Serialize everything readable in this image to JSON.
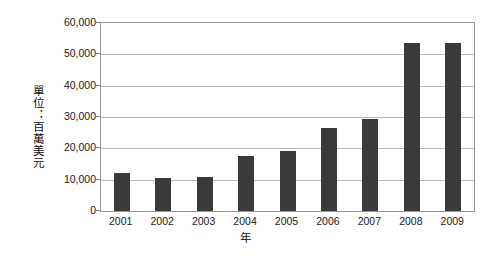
{
  "chart_data": {
    "type": "bar",
    "title": "",
    "subtitle": "",
    "xlabel": "年",
    "ylabel": "單位：百萬美元",
    "categories": [
      "2001",
      "2002",
      "2003",
      "2004",
      "2005",
      "2006",
      "2007",
      "2008",
      "2009"
    ],
    "values": [
      12000,
      10400,
      11000,
      17500,
      19000,
      26500,
      29500,
      53700,
      53500
    ],
    "ylim": [
      0,
      60000
    ],
    "ytick_labels": [
      "60,000",
      "50,000",
      "40,000",
      "30,000",
      "20,000",
      "10,000",
      "0"
    ],
    "ytick_values": [
      60000,
      50000,
      40000,
      30000,
      20000,
      10000,
      0
    ],
    "grid": true,
    "legend": null,
    "series_color": "#3a3a3a",
    "gridline_color": "#b8b8b8",
    "axis_color": "#9a9a9a"
  }
}
